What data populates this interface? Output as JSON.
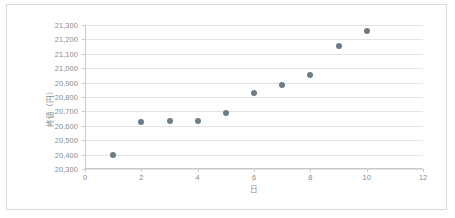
{
  "chart_data": {
    "type": "scatter",
    "title": "",
    "xlabel": "日",
    "ylabel": "終値（円）",
    "xlim": [
      0,
      12
    ],
    "ylim": [
      20300,
      21300
    ],
    "x_ticks": [
      "0",
      "2",
      "4",
      "6",
      "8",
      "10",
      "12"
    ],
    "x_tick_values": [
      0,
      2,
      4,
      6,
      8,
      10,
      12
    ],
    "y_ticks": [
      "21,300",
      "21,200",
      "21,100",
      "21,000",
      "20,900",
      "20,800",
      "20,700",
      "20,600",
      "20,500",
      "20,400",
      "20,300"
    ],
    "y_tick_values": [
      21300,
      21200,
      21100,
      21000,
      20900,
      20800,
      20700,
      20600,
      20500,
      20400,
      20300
    ],
    "grid": true,
    "legend": false,
    "series": [
      {
        "name": "終値",
        "marker_color": "#6f7b86",
        "x": [
          1,
          2,
          3,
          4,
          5,
          6,
          7,
          8,
          9,
          10
        ],
        "values": [
          20400,
          20625,
          20630,
          20630,
          20690,
          20825,
          20880,
          20955,
          21155,
          21260
        ]
      }
    ]
  },
  "colors": {
    "marker": "#6f7b86",
    "gridline": "#e4e4e4",
    "axis": "#c9c9c9",
    "tick_text": "#8a8a8a",
    "frame_border": "#d9d9d9",
    "background": "#ffffff"
  }
}
